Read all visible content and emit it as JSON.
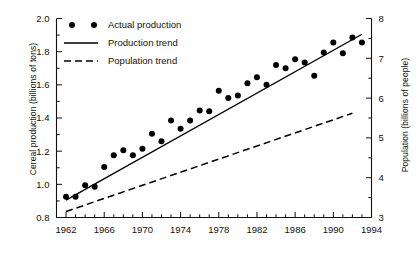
{
  "chart_data": {
    "type": "scatter",
    "title": "",
    "xlabel": "",
    "ylabel": "Cereal production (billions of tons)",
    "y2label": "Population (billions of people)",
    "xlim": [
      1961,
      1994
    ],
    "ylim": [
      0.8,
      2.0
    ],
    "y2lim": [
      3,
      8
    ],
    "grid": false,
    "legend_position": "top-left",
    "x_ticks_major": [
      1962,
      1966,
      1970,
      1974,
      1978,
      1982,
      1986,
      1990,
      1994
    ],
    "x_tick_labels": [
      "1962",
      "1966",
      "1970",
      "1974",
      "1978",
      "1982",
      "1986",
      "1990",
      "1994"
    ],
    "x_tick_minor_step": 1,
    "y_ticks_major": [
      0.8,
      1.0,
      1.2,
      1.4,
      1.6,
      1.8,
      2.0
    ],
    "y_tick_labels": [
      "0.8",
      "1.0",
      "1.2",
      "1.4",
      "1.6",
      "1.8",
      "2.0"
    ],
    "y_tick_minor_step": 0.1,
    "y2_ticks_major": [
      3,
      4,
      5,
      6,
      7,
      8
    ],
    "y2_tick_labels": [
      "3",
      "4",
      "5",
      "6",
      "7",
      "8"
    ],
    "y2_tick_minor_step": 0.5,
    "legend": [
      {
        "label": "Actual production",
        "marker": "dot"
      },
      {
        "label": "Production trend",
        "marker": "solid-line"
      },
      {
        "label": "Population trend",
        "marker": "dashed-line"
      }
    ],
    "series": [
      {
        "name": "Actual production",
        "type": "scatter",
        "axis": "left",
        "marker": "filled-circle",
        "color": "#000000",
        "x": [
          1962,
          1963,
          1964,
          1965,
          1966,
          1967,
          1968,
          1969,
          1970,
          1971,
          1972,
          1973,
          1974,
          1975,
          1976,
          1977,
          1978,
          1979,
          1980,
          1981,
          1982,
          1983,
          1984,
          1985,
          1986,
          1987,
          1988,
          1989,
          1990,
          1991,
          1992,
          1993
        ],
        "y": [
          0.925,
          0.925,
          0.995,
          0.985,
          1.105,
          1.175,
          1.205,
          1.175,
          1.215,
          1.305,
          1.26,
          1.385,
          1.335,
          1.385,
          1.445,
          1.44,
          1.565,
          1.52,
          1.535,
          1.61,
          1.645,
          1.6,
          1.72,
          1.7,
          1.755,
          1.735,
          1.655,
          1.795,
          1.855,
          1.79,
          1.885,
          1.855
        ]
      },
      {
        "name": "Production trend",
        "type": "line",
        "axis": "left",
        "style": "solid",
        "color": "#000000",
        "x": [
          1962,
          1993
        ],
        "y": [
          0.905,
          1.905
        ]
      },
      {
        "name": "Population trend",
        "type": "line",
        "axis": "right",
        "style": "dashed",
        "color": "#000000",
        "x": [
          1962,
          1992
        ],
        "y": [
          3.15,
          5.62
        ]
      }
    ]
  }
}
